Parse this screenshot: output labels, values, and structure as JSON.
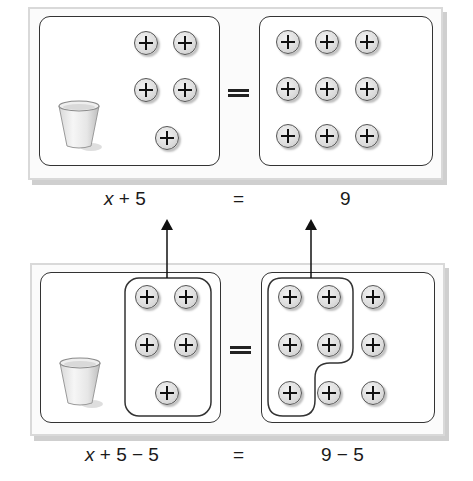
{
  "top_panel": {
    "left_mat": {
      "cup": "cup-icon",
      "counters": 5
    },
    "right_mat": {
      "counters": 9
    },
    "equation": {
      "left": "x + 5",
      "equals": "=",
      "right": "9"
    }
  },
  "bottom_panel": {
    "left_mat": {
      "cup": "cup-icon",
      "counters": 5,
      "grouped_removed": 5
    },
    "right_mat": {
      "counters": 9,
      "grouped_removed": 5
    },
    "equation": {
      "left": "x + 5 − 5",
      "equals": "=",
      "right": "9 − 5"
    }
  },
  "arrows": [
    {
      "from": "bottom-left-group",
      "to": "top-equation-left"
    },
    {
      "from": "bottom-right-group",
      "to": "top-equation-right"
    }
  ],
  "colors": {
    "frame": "#d9d9d9",
    "outline": "#333333",
    "counter_fill": "#dcdcdc"
  }
}
